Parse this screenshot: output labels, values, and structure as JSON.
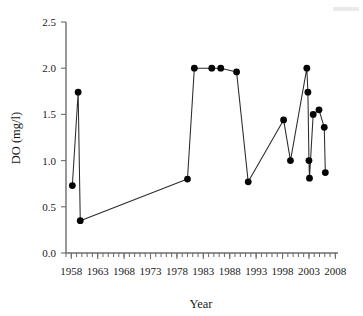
{
  "chart_data": {
    "type": "line",
    "title": "",
    "xlabel": "Year",
    "ylabel": "DO (mg/l)",
    "xlim": [
      1957,
      2008.5
    ],
    "ylim": [
      0.0,
      2.5
    ],
    "grid": false,
    "legend": "none",
    "marker": "filled-circle",
    "x_ticks": [
      1958,
      1963,
      1968,
      1973,
      1978,
      1983,
      1988,
      1993,
      1998,
      2003,
      2008
    ],
    "x_tick_labels": [
      "1958",
      "1963",
      "1968",
      "1973",
      "1978",
      "1983",
      "1988",
      "1993",
      "1998",
      "2003",
      "2008"
    ],
    "x_minor_tick_step": 1,
    "y_ticks": [
      0.0,
      0.5,
      1.0,
      1.5,
      2.0,
      2.5
    ],
    "y_tick_labels": [
      "0.0",
      "0.5",
      "1.0",
      "1.5",
      "2.0",
      "2.5"
    ],
    "series": [
      {
        "name": "DO",
        "color": "#050505",
        "x": [
          1958.2,
          1959.3,
          1959.7,
          1980.0,
          1981.3,
          1984.6,
          1986.3,
          1989.3,
          1991.5,
          1998.2,
          1999.5,
          2002.6,
          2002.8,
          2003.0,
          2003.1,
          2003.8,
          2004.9,
          2005.9,
          2006.1
        ],
        "y": [
          0.73,
          1.74,
          0.35,
          0.8,
          2.0,
          2.0,
          2.0,
          1.96,
          0.77,
          1.44,
          1.0,
          2.0,
          1.74,
          1.0,
          0.81,
          1.5,
          1.55,
          1.36,
          0.87
        ]
      }
    ]
  },
  "axis": {
    "x_title": "Year",
    "y_title": "DO (mg/l)"
  }
}
